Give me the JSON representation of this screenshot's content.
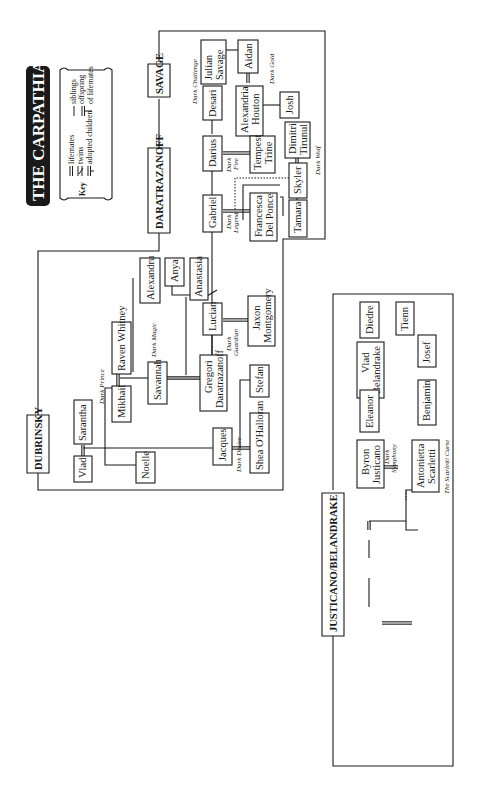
{
  "title": "THE CARPATHIANS",
  "key": {
    "label": "Key",
    "lifemates": "lifemates",
    "twins": "twins",
    "adopted": "adopted children",
    "siblings": "siblings",
    "offspring_1": "offspring",
    "offspring_2": "of lifemates"
  },
  "families": {
    "savage": "SAVAGE",
    "daratrazanoff": "DARATRAZANOFF",
    "dubrinsky": "DUBRINSKY",
    "justicano": "JUSTICANO/BELANDRAKE"
  },
  "people": {
    "julian": [
      "Julian",
      "Savage"
    ],
    "aidan": [
      "Aidan"
    ],
    "desari": [
      "Desari"
    ],
    "alexandria": [
      "Alexandria",
      "Houton"
    ],
    "josh": [
      "Josh"
    ],
    "darius": [
      "Darius"
    ],
    "tempest": [
      "Tempest",
      "Trine"
    ],
    "dimitri": [
      "Dimitri",
      "Tirunul"
    ],
    "skyler": [
      "Skyler"
    ],
    "gabriel": [
      "Gabriel"
    ],
    "francesca": [
      "Francesca",
      "Del Ponce"
    ],
    "tamara": [
      "Tamara"
    ],
    "alexandru": [
      "Alexandru"
    ],
    "anya": [
      "Anya"
    ],
    "anastasia": [
      "Anastasia"
    ],
    "lucian": [
      "Lucian"
    ],
    "jaxon": [
      "Jaxon",
      "Montgomery"
    ],
    "raven": [
      "Raven Whitney"
    ],
    "mikhail": [
      "Mikhail"
    ],
    "savannah": [
      "Savannah"
    ],
    "gregori": [
      "Gregori",
      "Daratrazanoff"
    ],
    "stefan": [
      "Stefan"
    ],
    "sarantha": [
      "Sarantha"
    ],
    "vlad_d": [
      "Vlad"
    ],
    "noelle": [
      "Noelle"
    ],
    "jacques": [
      "Jacques"
    ],
    "shea": [
      "Shea O'Halloran"
    ],
    "diedre": [
      "Diedre"
    ],
    "tienn": [
      "Tienn"
    ],
    "vlad_b": [
      "Vlad",
      "Belandrake"
    ],
    "josef": [
      "Josef"
    ],
    "eleanor": [
      "Eleanor"
    ],
    "benjamin": [
      "Benjamin"
    ],
    "byron": [
      "Byron",
      "Justicano"
    ],
    "antonietta": [
      "Antonietta",
      "Scarletti"
    ]
  },
  "books": {
    "dark_challenge": "Dark Challenge",
    "dark_gold": "Dark Gold",
    "dark_fire": [
      "Dark",
      "Fire"
    ],
    "dark_wolf": "Dark Wolf",
    "dark_legend": [
      "Dark",
      "Legend"
    ],
    "dark_guardian": [
      "Dark",
      "Guardian"
    ],
    "dark_magic": "Dark Magic",
    "dark_prince": "Dark Prince",
    "dark_desire": "Dark Desire",
    "dark_symphony": [
      "Dark",
      "Symphony"
    ],
    "scarletti_curse": "The Scarletti Curse"
  }
}
